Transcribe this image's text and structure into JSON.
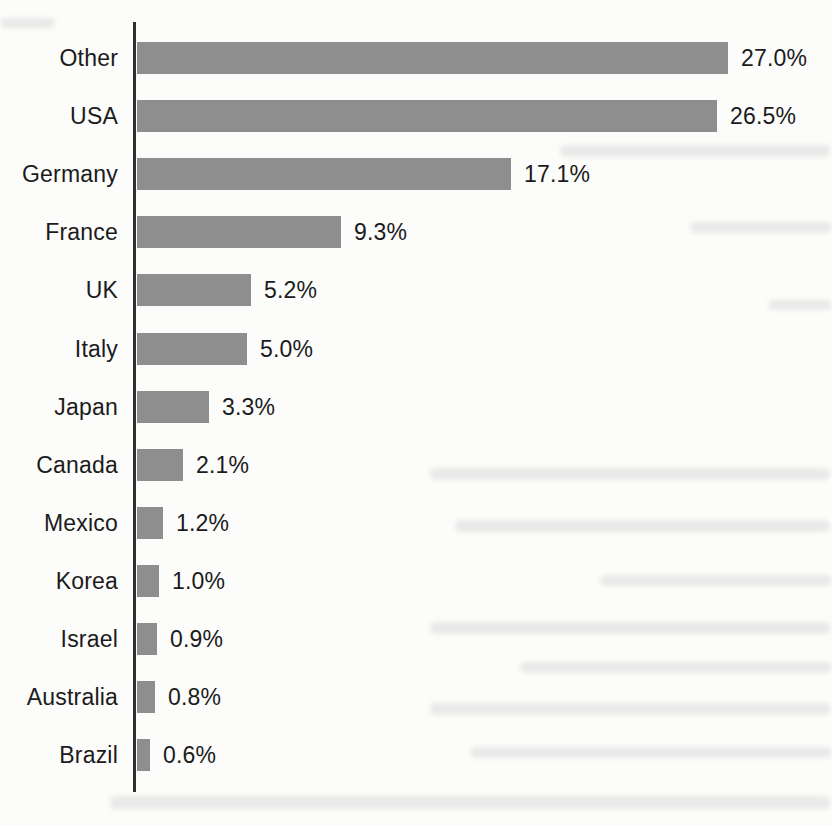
{
  "chart_data": {
    "type": "bar",
    "orientation": "horizontal",
    "title": "",
    "xlabel": "",
    "ylabel": "",
    "categories": [
      "Other",
      "USA",
      "Germany",
      "France",
      "UK",
      "Italy",
      "Japan",
      "Canada",
      "Mexico",
      "Korea",
      "Israel",
      "Australia",
      "Brazil"
    ],
    "values": [
      27.0,
      26.5,
      17.1,
      9.3,
      5.2,
      5.0,
      3.3,
      2.1,
      1.2,
      1.0,
      0.9,
      0.8,
      0.6
    ],
    "value_labels": [
      "27.0%",
      "26.5%",
      "17.1%",
      "9.3%",
      "5.2%",
      "5.0%",
      "3.3%",
      "2.1%",
      "1.2%",
      "1.0%",
      "0.9%",
      "0.8%",
      "0.6%"
    ],
    "xlim": [
      0,
      27
    ],
    "grid": false,
    "legend": false,
    "bar_color": "#8e8e8e",
    "axis_color": "#2f2f2f",
    "text_color": "#1b1b1b",
    "background_color": "#fcfcfb"
  }
}
